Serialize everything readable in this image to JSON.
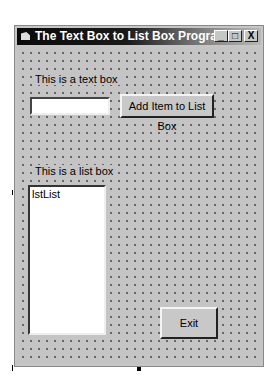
{
  "window": {
    "title": "The Text Box to List Box Program",
    "controls": {
      "minimize": "_",
      "maximize": "□",
      "close": "X"
    }
  },
  "form": {
    "textbox_label": "This is a text box",
    "textbox_value": "",
    "add_button_label": "Add Item to List Box",
    "listbox_label": "This is a list box",
    "listbox_items": [
      "lstList"
    ],
    "exit_button_label": "Exit"
  }
}
